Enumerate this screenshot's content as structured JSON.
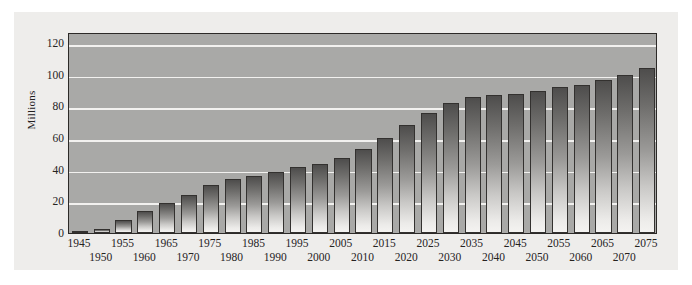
{
  "chart_data": {
    "type": "bar",
    "title": "",
    "subtitle": "",
    "xlabel": "",
    "ylabel": "Millions",
    "categories": [
      "1945",
      "1950",
      "1955",
      "1960",
      "1965",
      "1970",
      "1975",
      "1980",
      "1985",
      "1990",
      "1995",
      "2000",
      "2005",
      "2010",
      "2015",
      "2020",
      "2025",
      "2030",
      "2035",
      "2040",
      "2045",
      "2050",
      "2055",
      "2060",
      "2065",
      "2070",
      "2075"
    ],
    "values": [
      1,
      2.5,
      8,
      14,
      19,
      24,
      30.5,
      34,
      36,
      38.5,
      42,
      43.5,
      47.5,
      53,
      60,
      68,
      76,
      82,
      86,
      87,
      88,
      90,
      92,
      93.5,
      96.5,
      100,
      104
    ],
    "ylim": [
      0,
      127
    ],
    "yticks": [
      0,
      20,
      40,
      60,
      80,
      100,
      120
    ],
    "ytick_labels": [
      "0",
      "20",
      "40",
      "60",
      "80",
      "100",
      "120"
    ],
    "grid": true,
    "gridlines_at": [
      20,
      40,
      60,
      80,
      100,
      120
    ],
    "legend": null,
    "legend_position": "none",
    "annotations": [],
    "colors": {
      "plot_background": "#a9a9a7",
      "card_background": "#eeedeb",
      "page_background": "#ffffff",
      "gridline": "#f2f1ef",
      "bar_top": "#4e4d4c",
      "bar_bottom": "#f4f3f1",
      "bar_border": "#33312f",
      "axis_border": "#2c2a28",
      "text": "#26231f"
    },
    "xtick_rows": [
      0,
      1,
      0,
      1,
      0,
      1,
      0,
      1,
      0,
      1,
      0,
      1,
      0,
      1,
      0,
      1,
      0,
      1,
      0,
      1,
      0,
      1,
      0,
      1,
      0,
      1,
      0
    ]
  }
}
